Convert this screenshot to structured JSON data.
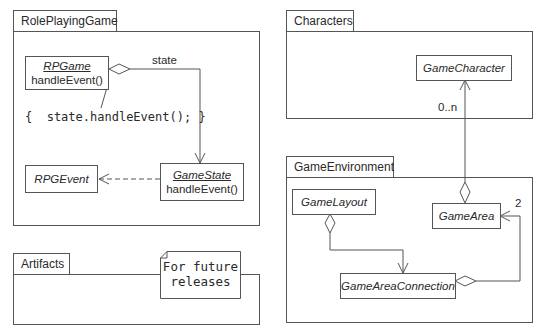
{
  "packages": {
    "role_playing_game": {
      "label": "RolePlayingGame",
      "classes": {
        "rpgame": {
          "name": "RPGame",
          "method": "handleEvent()"
        },
        "game_state": {
          "name": "GameState",
          "method": "handleEvent()"
        },
        "rpg_event": {
          "name": "RPGEvent"
        }
      },
      "association_label": "state",
      "code_note": "{  state.handleEvent(); }"
    },
    "characters": {
      "label": "Characters",
      "classes": {
        "game_character": {
          "name": "GameCharacter"
        }
      },
      "multiplicity": "0..n"
    },
    "game_environment": {
      "label": "GameEnvironment",
      "classes": {
        "game_layout": {
          "name": "GameLayout"
        },
        "game_area": {
          "name": "GameArea"
        },
        "game_area_connection": {
          "name": "GameAreaConnection"
        }
      },
      "multiplicity": "2"
    },
    "artifacts": {
      "label": "Artifacts",
      "note": {
        "line1": "For future",
        "line2": "releases"
      }
    }
  }
}
